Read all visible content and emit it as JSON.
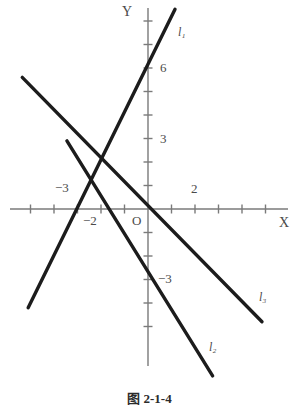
{
  "figure": {
    "caption": "图 2-1-4",
    "axis_labels": {
      "x": "X",
      "y": "Y",
      "origin": "O"
    }
  },
  "chart_data": {
    "type": "line",
    "title": "",
    "xlabel": "X",
    "ylabel": "Y",
    "xlim": [
      -5,
      6
    ],
    "ylim": [
      -7,
      8.5
    ],
    "grid": false,
    "legend": "inline-end-labels",
    "axis_color": "#7a7a7a",
    "line_color": "#1c1c1c",
    "label_color": "#4a4a4a",
    "x_ticks": [
      -5,
      -4,
      -3,
      -2,
      -1,
      1,
      2,
      3,
      4,
      5
    ],
    "y_ticks": [
      -5,
      -4,
      -3,
      -2,
      -1,
      1,
      2,
      3,
      4,
      5,
      6,
      7,
      8
    ],
    "x_tick_labels": [
      {
        "value": -3,
        "text": "−3"
      },
      {
        "value": -2,
        "text": "−2"
      },
      {
        "value": 2,
        "text": "2"
      }
    ],
    "y_tick_labels": [
      {
        "value": 6,
        "text": "6"
      },
      {
        "value": 3,
        "text": "3"
      },
      {
        "value": -3,
        "text": "−3"
      }
    ],
    "series": [
      {
        "name": "l1",
        "label": "l",
        "sub": "1",
        "slope": 2,
        "intercept": 6,
        "x_intercept": -3,
        "points": [
          [
            -5.1,
            -4.2
          ],
          [
            1.15,
            8.5
          ]
        ]
      },
      {
        "name": "l2",
        "label": "l",
        "sub": "2",
        "slope": -2,
        "intercept": -4,
        "x_intercept": -2,
        "points": [
          [
            -3.45,
            2.9
          ],
          [
            2.75,
            -7.1
          ]
        ]
      },
      {
        "name": "l3",
        "label": "l",
        "sub": "3",
        "slope": -1,
        "intercept": 2,
        "x_intercept": 2,
        "points": [
          [
            -5.35,
            5.6
          ],
          [
            4.85,
            -4.8
          ]
        ]
      }
    ],
    "annotations": [
      {
        "text": "l₁",
        "x": 1.35,
        "y": 7.3
      },
      {
        "text": "l₂",
        "x": 2.9,
        "y": -5.6
      },
      {
        "text": "l₃",
        "x": 5.05,
        "y": -3.4
      }
    ]
  }
}
